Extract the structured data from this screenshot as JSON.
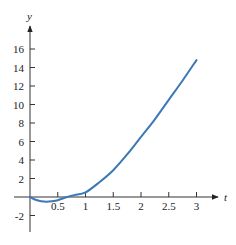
{
  "chart_data": {
    "type": "line",
    "title": "",
    "xlabel": "t",
    "ylabel": "y",
    "xlim": [
      0,
      3.3
    ],
    "ylim": [
      -3.5,
      18
    ],
    "grid": false,
    "x_ticks": [
      0.5,
      1,
      1.5,
      2,
      2.5,
      3
    ],
    "x_tick_labels": [
      "0.5",
      "1",
      "1.5",
      "2",
      "2.5",
      "3"
    ],
    "y_ticks": [
      -2,
      2,
      4,
      6,
      8,
      10,
      12,
      14,
      16
    ],
    "y_tick_labels": [
      "-2",
      "2",
      "4",
      "6",
      "8",
      "10",
      "12",
      "14",
      "16"
    ],
    "series": [
      {
        "name": "y(t)",
        "color": "#3a78b8",
        "x": [
          0,
          0.1,
          0.2,
          0.3,
          0.4,
          0.5,
          0.67,
          0.8,
          1.0,
          1.25,
          1.5,
          1.75,
          2.0,
          2.25,
          2.5,
          2.75,
          3.0
        ],
        "y": [
          0,
          -0.3,
          -0.45,
          -0.5,
          -0.45,
          -0.35,
          0,
          0.2,
          0.5,
          1.6,
          2.9,
          4.6,
          6.5,
          8.4,
          10.5,
          12.6,
          14.8
        ]
      }
    ],
    "legend": null
  },
  "colors": {
    "curve": "#3a78b8",
    "axis": "#333333"
  }
}
